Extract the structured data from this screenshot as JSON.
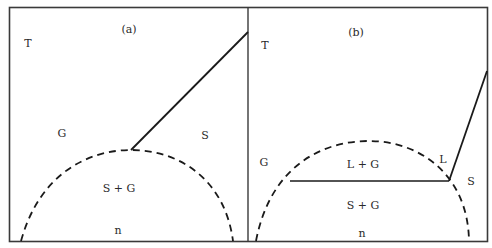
{
  "figure": {
    "type": "phase-diagram",
    "panels": [
      {
        "id": "a",
        "caption": "(a)",
        "axis_labels": {
          "y": "T",
          "x": "n"
        },
        "region_labels": {
          "gas": "G",
          "solid": "S",
          "coexistence": "S + G"
        },
        "curves": {
          "coexistence_boundary": "dashed dome",
          "phase_line": "solid line from dome peak to upper right"
        }
      },
      {
        "id": "b",
        "caption": "(b)",
        "axis_labels": {
          "y": "T",
          "x": "n"
        },
        "region_labels": {
          "gas": "G",
          "liquid": "L",
          "solid": "S",
          "liquid_gas": "L + G",
          "solid_gas": "S + G"
        },
        "curves": {
          "coexistence_boundary": "dashed dome",
          "triple_line": "horizontal solid line",
          "phase_line": "solid line from triple point to upper right"
        }
      }
    ]
  },
  "colors": {
    "line": "#1a1a1a",
    "frame": "#3a3a3a",
    "background": "#ffffff",
    "text": "#2a2a2a"
  }
}
